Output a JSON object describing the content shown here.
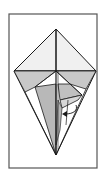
{
  "diagram": {
    "type": "origami-fold-step",
    "colors": {
      "background": "#ffffff",
      "frame": "#555555",
      "line": "#1a1a1a",
      "shade_light": "#ececec",
      "shade_mid": "#c8c8c8",
      "shade_dark": "#b4b4b4"
    },
    "icons": [
      "fold-arrow-icon"
    ]
  }
}
